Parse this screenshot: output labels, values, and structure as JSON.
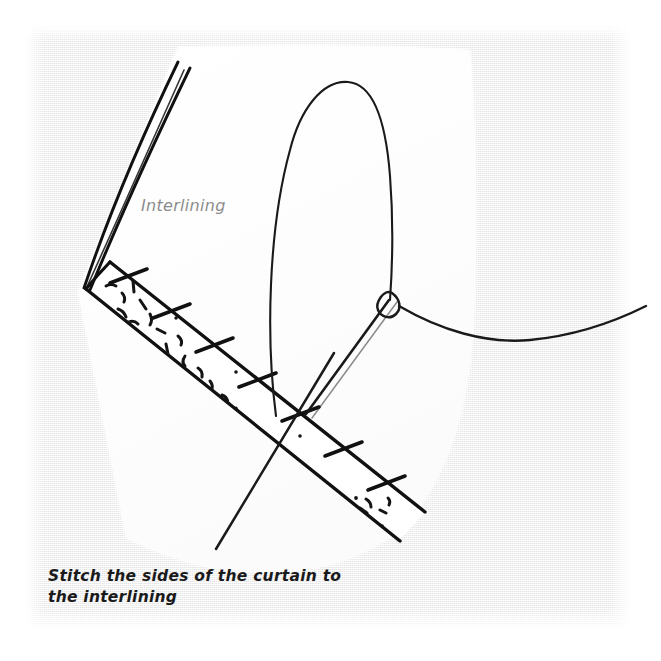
{
  "page": {
    "background_color": "#ffffff",
    "paper_color": "#efefef",
    "ink_color": "#1a1a1a",
    "fabric_color": "#fdfdfd",
    "label_color": "#8c8c8c",
    "width": 661,
    "height": 661
  },
  "illustration": {
    "title": "curtain-interlining-stitch-diagram",
    "subject": "hand sewing a curtain side hem to the interlining",
    "elements": {
      "fabric_panel": "curtain-fabric-panel",
      "folded_hem_band": "folded-hem-band",
      "fold_lines": "curtain-fold-lines",
      "stitch_marks": "slip-stitch-marks",
      "interlining_texture": "interlining-speckle-texture",
      "needle": "sewing-needle",
      "needle_eye": "needle-eye",
      "thread_loop": "thread-loop",
      "thread_tail": "thread-tail"
    }
  },
  "labels": {
    "interlining": "Interlining"
  },
  "caption": {
    "text": "Stitch the sides of the curtain to\nthe interlining"
  }
}
